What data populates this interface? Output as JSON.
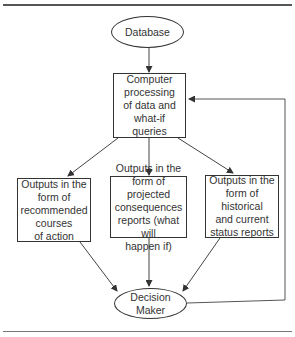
{
  "diagram": {
    "nodes": {
      "database": {
        "label": "Database",
        "shape": "ellipse"
      },
      "processing": {
        "label": "Computer\nprocessing\nof data and\nwhat-if\nqueries",
        "shape": "box"
      },
      "output_recommended": {
        "label": "Outputs in the\nform of\nrecommended\ncourses\nof action",
        "shape": "box"
      },
      "output_projected": {
        "label": "Outputs in the\nform of projected\nconsequences\nreports (what will\nhappen if)",
        "shape": "box"
      },
      "output_historical": {
        "label": "Outputs in the\nform of historical\nand current\nstatus reports",
        "shape": "box"
      },
      "decision_maker": {
        "label": "Decision Maker",
        "shape": "ellipse"
      }
    },
    "edges": [
      {
        "from": "database",
        "to": "processing"
      },
      {
        "from": "processing",
        "to": "output_recommended"
      },
      {
        "from": "processing",
        "to": "output_projected"
      },
      {
        "from": "processing",
        "to": "output_historical"
      },
      {
        "from": "output_recommended",
        "to": "decision_maker"
      },
      {
        "from": "output_projected",
        "to": "decision_maker"
      },
      {
        "from": "output_historical",
        "to": "decision_maker"
      },
      {
        "from": "decision_maker",
        "to": "processing",
        "type": "feedback-loop"
      }
    ],
    "colors": {
      "stroke": "#333333",
      "background": "#ffffff"
    }
  }
}
